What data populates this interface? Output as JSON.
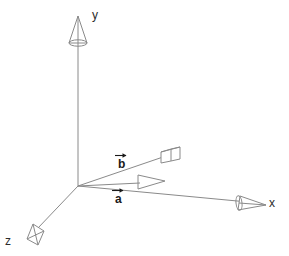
{
  "figure": {
    "background_color": "#ffffff",
    "stroke_color": "#8a8a8a",
    "label_color": "#2b2b2b",
    "vector_label_color": "#1a1a1a",
    "width": 289,
    "height": 256,
    "origin": {
      "x": 78,
      "y": 186
    }
  },
  "axes": [
    {
      "id": "y-axis",
      "label": "y",
      "label_x": 92,
      "label_y": 19,
      "from": {
        "x": 78,
        "y": 186
      },
      "to": {
        "x": 78,
        "y": 22
      },
      "arrowhead": "cone-3d-up"
    },
    {
      "id": "x-axis",
      "label": "x",
      "label_x": 269,
      "label_y": 207,
      "from": {
        "x": 78,
        "y": 186
      },
      "to": {
        "x": 264,
        "y": 204
      },
      "arrowhead": "cone-3d-right"
    },
    {
      "id": "z-axis",
      "label": "z",
      "label_x": 5,
      "label_y": 245,
      "from": {
        "x": 78,
        "y": 186
      },
      "to": {
        "x": 29,
        "y": 237
      },
      "arrowhead": "cone-3d-downleft"
    }
  ],
  "vectors": [
    {
      "id": "vector-a",
      "label": "a",
      "accent": "rightwards-arrow-above",
      "label_x": 116,
      "label_y": 202,
      "from": {
        "x": 78,
        "y": 186
      },
      "to": {
        "x": 164,
        "y": 181
      },
      "arrowhead": "flat-triangle-outline"
    },
    {
      "id": "vector-b",
      "label": "b",
      "accent": "rightwards-arrow-above",
      "label_x": 120,
      "label_y": 167,
      "from": {
        "x": 78,
        "y": 186
      },
      "to": {
        "x": 178,
        "y": 152
      },
      "arrowhead": "cone-3d-box"
    }
  ]
}
